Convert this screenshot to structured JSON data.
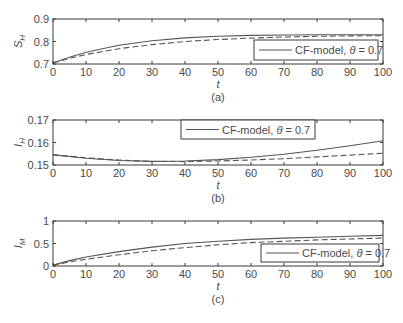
{
  "chart_data": [
    {
      "type": "line",
      "panel_label": "(a)",
      "xlabel": "t",
      "ylabel": "S_H",
      "xlim": [
        0,
        100
      ],
      "ylim": [
        0.7,
        0.9
      ],
      "xticks": [
        0,
        10,
        20,
        30,
        40,
        50,
        60,
        70,
        80,
        90,
        100
      ],
      "yticks": [
        "0.7",
        "0.8",
        "0.9"
      ],
      "grid": false,
      "legend": {
        "position": "lower right",
        "entries": [
          "CF-model, θ = 0.7"
        ]
      },
      "x": [
        0,
        5,
        10,
        20,
        30,
        40,
        50,
        60,
        70,
        80,
        90,
        100
      ],
      "series": [
        {
          "name": "CF-model, θ = 0.7",
          "style": "solid",
          "values": [
            0.705,
            0.73,
            0.752,
            0.783,
            0.803,
            0.816,
            0.823,
            0.827,
            0.829,
            0.83,
            0.83,
            0.83
          ]
        },
        {
          "name": "comparison",
          "style": "dashed",
          "values": [
            0.705,
            0.725,
            0.742,
            0.768,
            0.786,
            0.8,
            0.809,
            0.815,
            0.82,
            0.823,
            0.825,
            0.826
          ]
        }
      ]
    },
    {
      "type": "line",
      "panel_label": "(b)",
      "xlabel": "t",
      "ylabel": "I_H",
      "xlim": [
        0,
        100
      ],
      "ylim": [
        0.15,
        0.17
      ],
      "xticks": [
        0,
        10,
        20,
        30,
        40,
        50,
        60,
        70,
        80,
        90,
        100
      ],
      "yticks": [
        "0.15",
        "0.16",
        "0.17"
      ],
      "grid": false,
      "legend": {
        "position": "upper center",
        "entries": [
          "CF-model, θ = 0.7"
        ]
      },
      "x": [
        0,
        5,
        10,
        20,
        30,
        40,
        50,
        60,
        70,
        80,
        90,
        100
      ],
      "series": [
        {
          "name": "CF-model, θ = 0.7",
          "style": "solid",
          "values": [
            0.1545,
            0.1538,
            0.153,
            0.152,
            0.1516,
            0.1518,
            0.1524,
            0.1534,
            0.1548,
            0.1566,
            0.1586,
            0.1608
          ]
        },
        {
          "name": "comparison",
          "style": "dashed",
          "values": [
            0.1545,
            0.1539,
            0.1532,
            0.1522,
            0.1516,
            0.1515,
            0.1518,
            0.1522,
            0.1528,
            0.1536,
            0.1544,
            0.1552
          ]
        }
      ]
    },
    {
      "type": "line",
      "panel_label": "(c)",
      "xlabel": "t",
      "ylabel": "I_M",
      "xlim": [
        0,
        100
      ],
      "ylim": [
        0,
        1
      ],
      "xticks": [
        0,
        10,
        20,
        30,
        40,
        50,
        60,
        70,
        80,
        90,
        100
      ],
      "yticks": [
        "0",
        "0.5",
        "1"
      ],
      "grid": false,
      "legend": {
        "position": "lower right",
        "entries": [
          "CF-model, θ = 0.7"
        ]
      },
      "x": [
        0,
        5,
        10,
        20,
        30,
        40,
        50,
        60,
        70,
        80,
        90,
        100
      ],
      "series": [
        {
          "name": "CF-model, θ = 0.7",
          "style": "solid",
          "values": [
            0.02,
            0.12,
            0.2,
            0.32,
            0.42,
            0.5,
            0.55,
            0.59,
            0.62,
            0.64,
            0.66,
            0.68
          ]
        },
        {
          "name": "comparison",
          "style": "dashed",
          "values": [
            0.02,
            0.09,
            0.15,
            0.25,
            0.34,
            0.41,
            0.47,
            0.52,
            0.55,
            0.58,
            0.6,
            0.62
          ]
        }
      ]
    }
  ],
  "figure": {
    "panels": [
      {
        "ylabel_main": "S",
        "ylabel_sub": "H",
        "legend_text": "CF-model, ",
        "legend_theta": "θ",
        "legend_value": " = 0.7",
        "xlabel": "t",
        "caption": "(a)"
      },
      {
        "ylabel_main": "I",
        "ylabel_sub": "H",
        "legend_text": "CF-model, ",
        "legend_theta": "θ",
        "legend_value": " = 0.7",
        "xlabel": "t",
        "caption": "(b)"
      },
      {
        "ylabel_main": "I",
        "ylabel_sub": "M",
        "legend_text": "CF-model, ",
        "legend_theta": "θ",
        "legend_value": " = 0.7",
        "xlabel": "t",
        "caption": "(c)"
      }
    ]
  }
}
